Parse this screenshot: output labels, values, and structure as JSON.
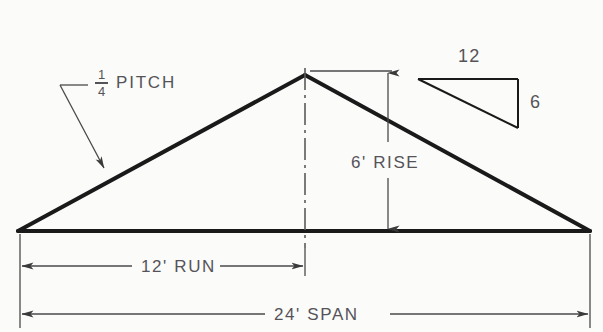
{
  "diagram": {
    "colors": {
      "background": "#fbfbfa",
      "line": "#1a1a1a",
      "text": "#555358",
      "thin_line": "#4a4a4a"
    },
    "labels": {
      "pitch_numerator": "1",
      "pitch_denominator": "4",
      "pitch_word": "PITCH",
      "rise": "6' RISE",
      "run": "12' RUN",
      "span": "24' SPAN",
      "slope_run": "12",
      "slope_rise": "6"
    },
    "values": {
      "pitch_fraction": "1/4",
      "rise_feet": 6,
      "run_feet": 12,
      "span_feet": 24,
      "slope_ratio_run": 12,
      "slope_ratio_rise": 6
    },
    "geometry": {
      "left_eave": [
        18,
        231
      ],
      "ridge_apex": [
        305,
        75
      ],
      "right_eave": [
        590,
        231
      ],
      "centerline_top": [
        305,
        72
      ],
      "centerline_bottom": [
        305,
        245
      ],
      "rise_dim_x": 388,
      "rise_dim_top_y": 71,
      "rise_dim_bottom_y": 231,
      "run_dim_y": 266,
      "span_dim_y": 314
    }
  }
}
